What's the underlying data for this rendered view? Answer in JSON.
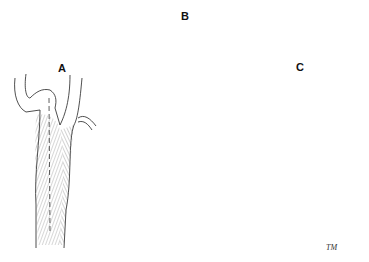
{
  "figure": {
    "panels": [
      {
        "label": "A",
        "description": "Carotid bifurcation with dashed longitudinal incision line"
      },
      {
        "label": "B",
        "description": "Opened vessel with everted plaque and double-armed suture with needles"
      },
      {
        "label": "C",
        "description": "Closed arteriotomy with running suture line"
      }
    ],
    "signature": "TM",
    "colors": {
      "ink": "#222222",
      "background": "#ffffff"
    }
  }
}
